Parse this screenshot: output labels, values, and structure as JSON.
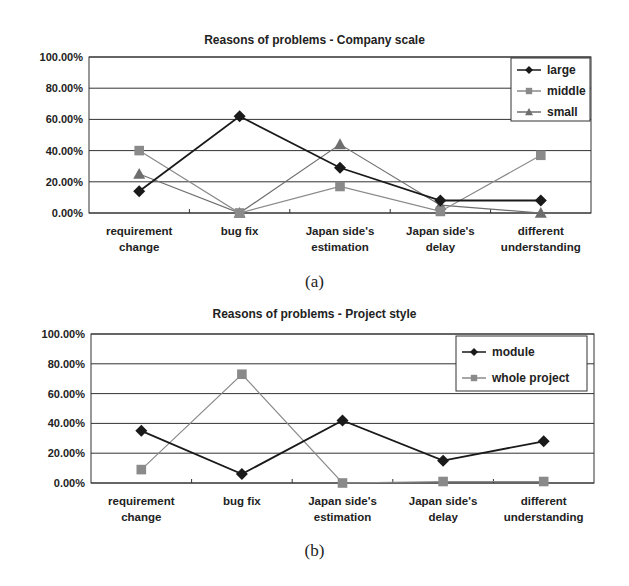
{
  "chart_data": [
    {
      "type": "line",
      "title": "Reasons of problems - Company scale",
      "caption": "(a)",
      "categories": [
        "requirement change",
        "bug fix",
        "Japan side's estimation",
        "Japan side's delay",
        "different understanding"
      ],
      "category_lines": [
        [
          "requirement",
          "change"
        ],
        [
          "bug fix"
        ],
        [
          "Japan side's",
          "estimation"
        ],
        [
          "Japan side's",
          "delay"
        ],
        [
          "different",
          "understanding"
        ]
      ],
      "series": [
        {
          "name": "large",
          "marker": "diamond",
          "color": "#1a1a1a",
          "values": [
            14,
            62,
            29,
            8,
            8
          ]
        },
        {
          "name": "middle",
          "marker": "square",
          "color": "#8a8a8a",
          "values": [
            40,
            0,
            17,
            1,
            37
          ]
        },
        {
          "name": "small",
          "marker": "triangle",
          "color": "#6e6e6e",
          "values": [
            25,
            0,
            44,
            5,
            0
          ]
        }
      ],
      "yticks": [
        "0.00%",
        "20.00%",
        "40.00%",
        "60.00%",
        "80.00%",
        "100.00%"
      ],
      "ylim": [
        0,
        100
      ],
      "xlabel": "",
      "ylabel": "",
      "grid": true,
      "legend_position": "top-right"
    },
    {
      "type": "line",
      "title": "Reasons of problems - Project style",
      "caption": "(b)",
      "categories": [
        "requirement change",
        "bug fix",
        "Japan side's estimation",
        "Japan side's delay",
        "different understanding"
      ],
      "category_lines": [
        [
          "requirement",
          "change"
        ],
        [
          "bug fix"
        ],
        [
          "Japan side's",
          "estimation"
        ],
        [
          "Japan side's",
          "delay"
        ],
        [
          "different",
          "understanding"
        ]
      ],
      "series": [
        {
          "name": "module",
          "marker": "diamond",
          "color": "#1a1a1a",
          "values": [
            35,
            6,
            42,
            15,
            28
          ]
        },
        {
          "name": "whole project",
          "marker": "square",
          "color": "#8a8a8a",
          "values": [
            9,
            73,
            0,
            1,
            1
          ]
        }
      ],
      "yticks": [
        "0.00%",
        "20.00%",
        "40.00%",
        "60.00%",
        "80.00%",
        "100.00%"
      ],
      "ylim": [
        0,
        100
      ],
      "xlabel": "",
      "ylabel": "",
      "grid": true,
      "legend_position": "top-right"
    }
  ]
}
